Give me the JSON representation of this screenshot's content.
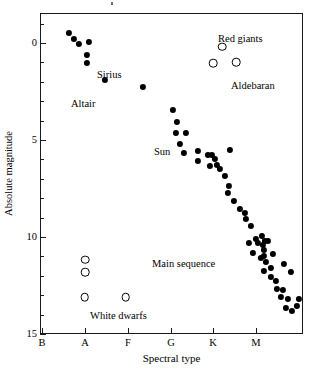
{
  "chart_data": {
    "type": "scatter",
    "title": "",
    "xlabel": "Spectral type",
    "ylabel": "Absolute magnitude",
    "xticklabels": [
      "B",
      "A",
      "F",
      "G",
      "K",
      "M"
    ],
    "xtick_positions": [
      42,
      85,
      128,
      171,
      213,
      256
    ],
    "yticklabels": [
      "0",
      "5",
      "10",
      "15"
    ],
    "ytick_values": [
      0,
      5,
      10,
      15
    ],
    "ylim": [
      -1.55,
      15
    ],
    "y_inverted": true,
    "grid": false,
    "legend": "none",
    "annotations": [
      {
        "text": "Red giants",
        "x": 218,
        "y": 33
      },
      {
        "text": "Sirius",
        "x": 97,
        "y": 69
      },
      {
        "text": "Aldebaran",
        "x": 231,
        "y": 80
      },
      {
        "text": "Altair",
        "x": 71,
        "y": 98
      },
      {
        "text": "Sun",
        "x": 154,
        "y": 146
      },
      {
        "text": "Main sequence",
        "x": 152,
        "y": 258
      },
      {
        "text": "White dwarfs",
        "x": 90,
        "y": 310
      }
    ],
    "series": [
      {
        "name": "Main sequence and bright stars",
        "marker": "filled-circle",
        "color": "#000000",
        "points": [
          [
            68.5,
            33.0
          ],
          [
            73.5,
            38.5
          ],
          [
            78.5,
            43.5
          ],
          [
            88.5,
            42.0
          ],
          [
            87.0,
            55.0
          ],
          [
            87.0,
            62.5
          ],
          [
            104.5,
            80.0
          ],
          [
            143.0,
            86.5
          ],
          [
            173.0,
            110.0
          ],
          [
            177.0,
            122.0
          ],
          [
            175.5,
            133.0
          ],
          [
            185.5,
            132.5
          ],
          [
            179.5,
            143.5
          ],
          [
            184.0,
            153.0
          ],
          [
            198.0,
            150.5
          ],
          [
            197.5,
            160.5
          ],
          [
            207.5,
            155.0
          ],
          [
            212.0,
            155.0
          ],
          [
            214.5,
            158.5
          ],
          [
            210.0,
            165.5
          ],
          [
            217.0,
            164.5
          ],
          [
            219.5,
            169.0
          ],
          [
            225.0,
            175.5
          ],
          [
            230.0,
            150.0
          ],
          [
            228.5,
            186.0
          ],
          [
            228.0,
            192.5
          ],
          [
            234.0,
            201.0
          ],
          [
            240.0,
            209.0
          ],
          [
            244.5,
            212.5
          ],
          [
            245.5,
            219.0
          ],
          [
            251.0,
            226.0
          ],
          [
            248.5,
            243.0
          ],
          [
            256.0,
            239.0
          ],
          [
            262.0,
            235.5
          ],
          [
            258.0,
            243.0
          ],
          [
            262.5,
            245.0
          ],
          [
            265.0,
            241.0
          ],
          [
            264.0,
            249.5
          ],
          [
            268.0,
            241.0
          ],
          [
            252.5,
            252.5
          ],
          [
            260.5,
            257.5
          ],
          [
            264.0,
            255.5
          ],
          [
            266.0,
            262.0
          ],
          [
            272.5,
            254.0
          ],
          [
            264.0,
            271.0
          ],
          [
            270.5,
            268.0
          ],
          [
            271.0,
            276.5
          ],
          [
            275.5,
            280.5
          ],
          [
            276.5,
            288.5
          ],
          [
            282.5,
            289.5
          ],
          [
            281.0,
            297.0
          ],
          [
            287.5,
            299.0
          ],
          [
            286.0,
            307.5
          ],
          [
            292.0,
            310.5
          ],
          [
            296.5,
            305.5
          ],
          [
            299.0,
            299.0
          ],
          [
            283.5,
            264.0
          ],
          [
            290.5,
            272.0
          ]
        ]
      },
      {
        "name": "Red giants",
        "marker": "open-circle",
        "color": "#000000",
        "points": [
          [
            222.0,
            46.5
          ],
          [
            213.0,
            63.0
          ],
          [
            236.0,
            62.0
          ]
        ]
      },
      {
        "name": "White dwarfs",
        "marker": "open-circle",
        "color": "#000000",
        "points": [
          [
            85.0,
            259.5
          ],
          [
            85.0,
            272.0
          ],
          [
            84.5,
            297.0
          ],
          [
            125.5,
            297.0
          ]
        ]
      }
    ]
  }
}
